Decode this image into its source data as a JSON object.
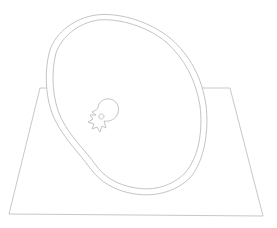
{
  "diagram": {
    "stroke_color": "#c4c4c4",
    "background": "#ffffff",
    "elements": [
      {
        "name": "plane",
        "shape": "quadrilateral",
        "points": [
          [
            40,
            88
          ],
          [
            230,
            88
          ],
          [
            263,
            216
          ],
          [
            9,
            214
          ]
        ]
      },
      {
        "name": "outer-contour",
        "shape": "closed-curve"
      },
      {
        "name": "inner-contour",
        "shape": "closed-curve"
      },
      {
        "name": "vertebra",
        "shape": "small-outline",
        "center": [
          105,
          118
        ]
      }
    ]
  }
}
